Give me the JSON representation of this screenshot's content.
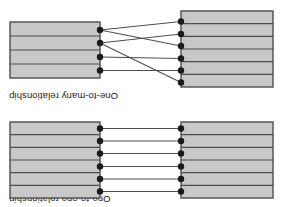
{
  "figure": {
    "orientation": "rotated-180",
    "background_color": "#ffffff",
    "panels": [
      {
        "id": "one-to-one",
        "label": "One-to-one relationship",
        "description": "Two stacked record tables joined by straight parallel connector lines",
        "left_table": {
          "rows": 6,
          "x": 14,
          "y": 9,
          "width": 92,
          "height": 76,
          "fill": "#c8c8c8",
          "stroke": "#4d4d4d"
        },
        "right_table": {
          "rows": 6,
          "x": 187,
          "y": 9,
          "width": 90,
          "height": 76,
          "fill": "#c8c8c8",
          "stroke": "#4d4d4d"
        },
        "left_node_x": 106,
        "right_node_x": 187,
        "node_ys": [
          15.5,
          28,
          40.5,
          53.5,
          66,
          78.5
        ],
        "node_radius": 3.2,
        "node_color": "#1a1a1a",
        "connector_color": "#4d4d4d",
        "connections": [
          {
            "from": 0,
            "to": 0
          },
          {
            "from": 1,
            "to": 1
          },
          {
            "from": 2,
            "to": 2
          },
          {
            "from": 3,
            "to": 3
          },
          {
            "from": 4,
            "to": 4
          },
          {
            "from": 5,
            "to": 5
          }
        ]
      },
      {
        "id": "one-to-many",
        "label": "One-to-many relationship",
        "description": "Six records on the left fan out and cross over to four records on the right",
        "left_table": {
          "rows": 6,
          "x": 14,
          "y": 17,
          "width": 92,
          "height": 76,
          "fill": "#c8c8c8",
          "stroke": "#4d4d4d"
        },
        "right_table": {
          "rows": 4,
          "x": 187,
          "y": 26,
          "width": 90,
          "height": 56,
          "fill": "#c8c8c8",
          "stroke": "#4d4d4d"
        },
        "left_node_x": 106,
        "right_node_x": 187,
        "left_node_ys": [
          21.5,
          33.5,
          45.5,
          58,
          70,
          82.5
        ],
        "right_node_ys": [
          33.5,
          47,
          61,
          74
        ],
        "node_radius": 3.2,
        "node_color": "#1a1a1a",
        "connector_color": "#4d4d4d",
        "connections": [
          {
            "from": 0,
            "to": 2
          },
          {
            "from": 1,
            "to": 0
          },
          {
            "from": 2,
            "to": 1
          },
          {
            "from": 3,
            "to": 3
          },
          {
            "from": 4,
            "to": 2
          },
          {
            "from": 5,
            "to": 3
          }
        ]
      }
    ]
  }
}
